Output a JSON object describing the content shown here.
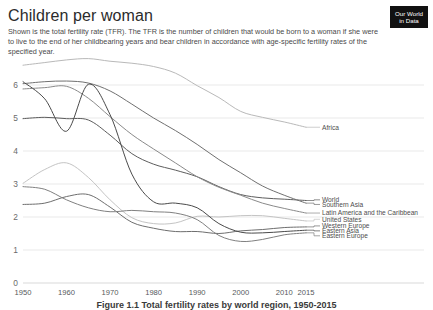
{
  "header": {
    "title": "Children per woman",
    "subtitle": "Shown is the total fertility rate (TFR). The TFR is the number of children that would be born to a woman if she were to live to the end of her childbearing years and bear children in accordance with age-specific fertility rates of the specified year."
  },
  "logo": {
    "line1": "Our World",
    "line2": "in Data"
  },
  "caption": {
    "text": "Figure 1.1 Total fertility rates by world region, 1950-2015"
  },
  "chart_data": {
    "type": "line",
    "title": "Children per woman",
    "subtitle": "Shown is the total fertility rate (TFR). The TFR is the number of children that would be born to a woman if she were to live to the end of her childbearing years and bear children in accordance with age-specific fertility rates of the specified year.",
    "xlabel": "",
    "ylabel": "",
    "xlim": [
      1950,
      2015
    ],
    "ylim": [
      0,
      6.8
    ],
    "grid": true,
    "legend_position": "right-inline",
    "x_tick_labels": [
      "1950",
      "1960",
      "1970",
      "1980",
      "1990",
      "2000",
      "2010",
      "2015"
    ],
    "x_ticks": [
      1950,
      1960,
      1970,
      1980,
      1990,
      2000,
      2010,
      2015
    ],
    "y_tick_labels": [
      "0",
      "1",
      "2",
      "3",
      "4",
      "5",
      "6"
    ],
    "y_ticks": [
      0,
      1,
      2,
      3,
      4,
      5,
      6
    ],
    "x": [
      1950,
      1955,
      1960,
      1965,
      1970,
      1975,
      1980,
      1985,
      1990,
      1995,
      2000,
      2005,
      2010,
      2015
    ],
    "series": [
      {
        "name": "Africa",
        "color": "#b9b9b9",
        "label_y": 4.72,
        "values": [
          6.6,
          6.68,
          6.76,
          6.8,
          6.72,
          6.66,
          6.56,
          6.36,
          5.98,
          5.62,
          5.2,
          5.02,
          4.88,
          4.72
        ]
      },
      {
        "name": "World",
        "color": "#5d5d5d",
        "label_y": 2.52,
        "values": [
          4.98,
          5.02,
          4.98,
          4.94,
          4.48,
          3.92,
          3.6,
          3.42,
          3.22,
          2.92,
          2.68,
          2.58,
          2.54,
          2.5
        ]
      },
      {
        "name": "Southern Asia",
        "color": "#707070",
        "label_y": 2.38,
        "values": [
          6.04,
          6.1,
          6.12,
          6.06,
          5.82,
          5.42,
          5.0,
          4.62,
          4.2,
          3.74,
          3.34,
          2.94,
          2.66,
          2.42
        ]
      },
      {
        "name": "Latin America and the Caribbean",
        "color": "#8a8a8a",
        "label_y": 2.12,
        "values": [
          5.88,
          5.92,
          5.96,
          5.6,
          5.04,
          4.5,
          4.06,
          3.64,
          3.22,
          2.9,
          2.66,
          2.42,
          2.26,
          2.12
        ]
      },
      {
        "name": "United States",
        "color": "#c4c4c4",
        "label_y": 1.93,
        "values": [
          3.02,
          3.44,
          3.64,
          3.2,
          2.52,
          1.98,
          1.8,
          1.82,
          2.02,
          2.0,
          2.04,
          2.04,
          1.96,
          1.88
        ]
      },
      {
        "name": "Western Europe",
        "color": "#6e6e6e",
        "label_y": 1.73,
        "values": [
          2.38,
          2.42,
          2.62,
          2.68,
          2.3,
          1.84,
          1.66,
          1.56,
          1.56,
          1.5,
          1.58,
          1.62,
          1.68,
          1.7
        ]
      },
      {
        "name": "Eastern Asia",
        "color": "#4a4a4a",
        "label_y": 1.58,
        "values": [
          6.1,
          5.58,
          4.6,
          6.02,
          5.1,
          3.3,
          2.46,
          2.42,
          2.28,
          1.8,
          1.54,
          1.52,
          1.56,
          1.6
        ]
      },
      {
        "name": "Eastern Europe",
        "color": "#808080",
        "label_y": 1.43,
        "values": [
          2.92,
          2.84,
          2.52,
          2.28,
          2.16,
          2.2,
          2.16,
          2.12,
          1.92,
          1.44,
          1.26,
          1.32,
          1.46,
          1.52
        ]
      }
    ]
  }
}
